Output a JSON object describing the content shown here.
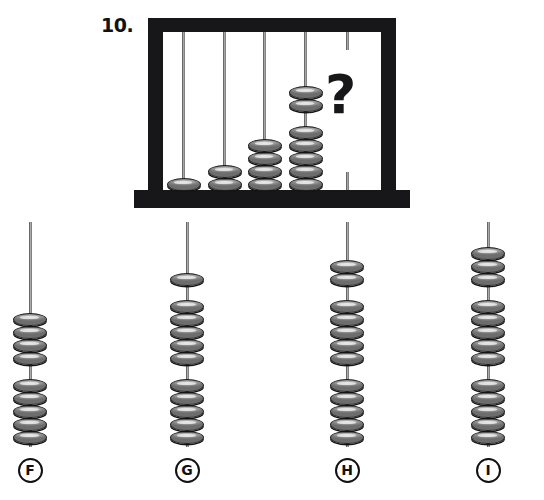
{
  "question": {
    "number": "10.",
    "unknown_marker": "?"
  },
  "abacus": {
    "name": "abacus-frame",
    "frame_color": "#17171a",
    "bead_color": "#8a8a8a",
    "rod_color": "#9a9a9a",
    "rods": [
      {
        "id": "rod-1",
        "x": 34,
        "bead_count": 1,
        "groups": [
          1
        ]
      },
      {
        "id": "rod-2",
        "x": 75,
        "bead_count": 2,
        "groups": [
          2
        ]
      },
      {
        "id": "rod-3",
        "x": 115,
        "bead_count": 4,
        "groups": [
          4
        ]
      },
      {
        "id": "rod-4",
        "x": 156,
        "bead_count": 7,
        "groups": [
          2,
          5
        ]
      },
      {
        "id": "rod-5",
        "x": 198,
        "bead_count": 0,
        "groups": [],
        "is_unknown": true
      }
    ]
  },
  "options": [
    {
      "letter": "F",
      "x": 30,
      "bead_count": 9,
      "groups": [
        4,
        5
      ]
    },
    {
      "letter": "G",
      "x": 187,
      "bead_count": 11,
      "groups": [
        1,
        5,
        5
      ]
    },
    {
      "letter": "H",
      "x": 347,
      "bead_count": 12,
      "groups": [
        2,
        5,
        5
      ]
    },
    {
      "letter": "I",
      "x": 488,
      "bead_count": 13,
      "groups": [
        3,
        5,
        5
      ]
    }
  ]
}
